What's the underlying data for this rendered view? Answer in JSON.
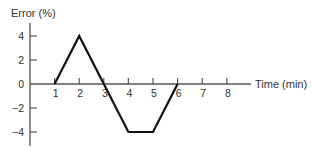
{
  "chart_data": {
    "type": "line",
    "title": "",
    "xlabel": "Time (min)",
    "ylabel": "Error (%)",
    "x_ticks": [
      "1",
      "2",
      "3",
      "4",
      "5",
      "6",
      "7",
      "8"
    ],
    "y_ticks": [
      "4",
      "2",
      "0",
      "−2",
      "−4"
    ],
    "xlim": [
      0,
      8.9
    ],
    "ylim": [
      -5,
      5
    ],
    "grid": false,
    "legend": null,
    "series": [
      {
        "name": "Error",
        "x": [
          1,
          2,
          4,
          5,
          6
        ],
        "y": [
          0,
          4,
          -4,
          -4,
          0
        ]
      }
    ]
  }
}
